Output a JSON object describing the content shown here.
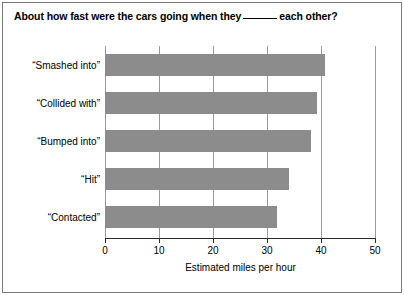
{
  "chart_data": {
    "type": "bar",
    "orientation": "horizontal",
    "title_prefix": "About how fast were the cars going when they",
    "title_suffix": "each other?",
    "categories": [
      "“Smashed into”",
      "“Collided with”",
      "“Bumped into”",
      "“Hit”",
      "“Contacted”"
    ],
    "values": [
      40.8,
      39.3,
      38.1,
      34.0,
      31.8
    ],
    "xlabel": "Estimated miles per hour",
    "ylabel": "",
    "xlim": [
      0,
      50
    ],
    "xticks": [
      "0",
      "10",
      "20",
      "30",
      "40",
      "50"
    ],
    "xtick_values": [
      0,
      10,
      20,
      30,
      40,
      50
    ],
    "grid": true,
    "legend": false,
    "bar_color": "#8c8c8c",
    "axis_color": "#2b2b2b",
    "grid_color": "#9a9a9a",
    "frame_color": "#7a7a7a"
  }
}
